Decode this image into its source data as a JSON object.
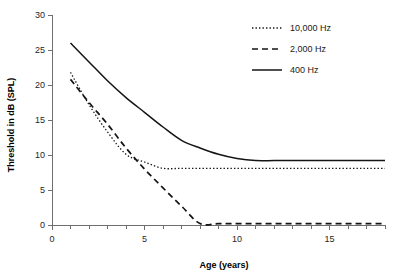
{
  "chart_data": {
    "type": "line",
    "title": "",
    "xlabel": "Age (years)",
    "ylabel": "Threshold in dB (SPL)",
    "xlim": [
      0,
      18
    ],
    "ylim": [
      0,
      30
    ],
    "xticks": [
      0,
      5,
      10,
      15
    ],
    "xtick_labels": [
      "0",
      "5",
      "10",
      "15"
    ],
    "xminor_step": 1,
    "yticks": [
      0,
      5,
      10,
      15,
      20,
      25,
      30
    ],
    "ytick_labels": [
      "0",
      "5",
      "10",
      "15",
      "20",
      "25",
      "30"
    ],
    "grid": false,
    "legend_position": "top-right",
    "x": [
      1,
      2,
      3,
      4,
      5,
      6,
      7,
      8,
      9,
      10,
      11,
      12,
      13,
      14,
      15,
      16,
      17,
      18
    ],
    "series": [
      {
        "name": "10,000 Hz",
        "style": "dotted",
        "values": [
          21.8,
          17.2,
          13.3,
          10.1,
          9.0,
          8.1,
          8.1,
          8.1,
          8.1,
          8.1,
          8.1,
          8.1,
          8.1,
          8.1,
          8.1,
          8.1,
          8.1,
          8.1
        ]
      },
      {
        "name": "2,000 Hz",
        "style": "dashed",
        "values": [
          20.8,
          17.5,
          14.4,
          11.0,
          8.0,
          5.3,
          2.7,
          0.2,
          0.2,
          0.2,
          0.2,
          0.2,
          0.2,
          0.2,
          0.2,
          0.2,
          0.2,
          0.2
        ]
      },
      {
        "name": "400 Hz",
        "style": "solid",
        "values": [
          26.0,
          23.3,
          20.6,
          18.2,
          16.1,
          14.0,
          12.1,
          11.0,
          10.1,
          9.5,
          9.2,
          9.2,
          9.2,
          9.2,
          9.2,
          9.2,
          9.2,
          9.2
        ]
      }
    ]
  },
  "legend": {
    "items": [
      {
        "label": "10,000 Hz"
      },
      {
        "label": "2,000 Hz"
      },
      {
        "label": "400 Hz"
      }
    ]
  },
  "axes": {
    "x_title": "Age (years)",
    "y_title": "Threshold in dB (SPL)"
  },
  "colors": {
    "line": "#141414",
    "axis": "#6e6e6e",
    "text": "#1a1a1a",
    "background": "#ffffff"
  }
}
